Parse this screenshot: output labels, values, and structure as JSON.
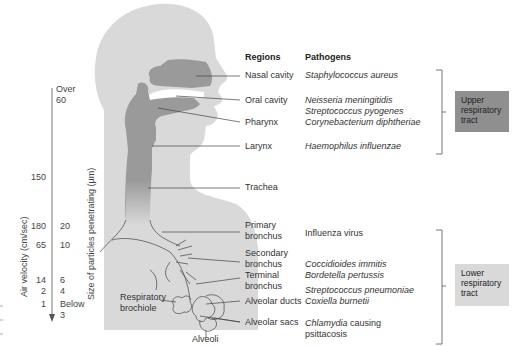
{
  "headers": {
    "regions": "Regions",
    "pathogens": "Pathogens"
  },
  "rows": [
    {
      "region": "Nasal cavity",
      "pathogens": [
        "Staphylococcus aureus"
      ]
    },
    {
      "region": "Oral cavity",
      "pathogens": [
        "Neisseria meningitidis",
        "Streptococcus pyogenes"
      ]
    },
    {
      "region": "Pharynx",
      "pathogens": [
        "Corynebacterium diphtheriae"
      ]
    },
    {
      "region": "Larynx",
      "pathogens": [
        "Haemophilus influenzae"
      ]
    },
    {
      "region": "Trachea",
      "pathogens": []
    },
    {
      "region": [
        "Primary",
        "bronchus"
      ],
      "pathogens": [
        "Influenza virus"
      ]
    },
    {
      "region": [
        "Secondary",
        "bronchus"
      ],
      "pathogens": [
        "Coccidioides immitis"
      ]
    },
    {
      "region": [
        "Terminal",
        "bronchus"
      ],
      "pathogens": [
        "Bordetella pertussis",
        "Streptococcus pneumoniae"
      ]
    },
    {
      "region": "Alveolar ducts",
      "pathogens": [
        "Coxiella burnetii"
      ]
    },
    {
      "region": "Alveolar sacs",
      "pathogens": [
        "Chlamydia causing",
        "psittacosis"
      ]
    }
  ],
  "anatomy_labels": {
    "respiratory_brochiole": [
      "Respiratory",
      "brochiole"
    ],
    "alveoli": "Alveoli"
  },
  "tract_boxes": {
    "upper": {
      "lines": [
        "Upper",
        "respiratory",
        "tract"
      ],
      "color": "#8f8f8f"
    },
    "lower": {
      "lines": [
        "Lower",
        "respiratory",
        "tract"
      ],
      "color": "#d9d9d9"
    }
  },
  "axes": {
    "air_velocity_label": "Air velocity  (cm/sec)",
    "particle_size_label": "Size of particles penetrating (µm)",
    "air_velocity_values": [
      "150",
      "180",
      "65",
      "14",
      "2",
      "1"
    ],
    "particle_size_values": [
      [
        "Over",
        "60"
      ],
      "20",
      "10",
      "6",
      "4",
      [
        "Below",
        "3"
      ]
    ]
  },
  "colors": {
    "body": "#d9d9d9",
    "airway": "#9a9a9a",
    "line": "#555555"
  }
}
